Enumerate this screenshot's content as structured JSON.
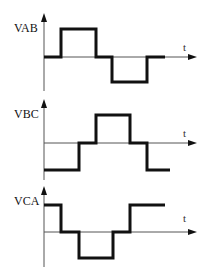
{
  "panels": [
    {
      "label": "VAB",
      "time_label": "t",
      "levels": [
        "0",
        "+",
        "0",
        "-",
        "0"
      ]
    },
    {
      "label": "VBC",
      "time_label": "t",
      "levels": [
        "-",
        "0",
        "+",
        "0",
        "-"
      ]
    },
    {
      "label": "VCA",
      "time_label": "t",
      "levels": [
        "+",
        "0",
        "-",
        "0",
        "+"
      ]
    }
  ],
  "colors": {
    "waveform": "#111111",
    "axis": "#555555",
    "background": "#ffffff"
  }
}
